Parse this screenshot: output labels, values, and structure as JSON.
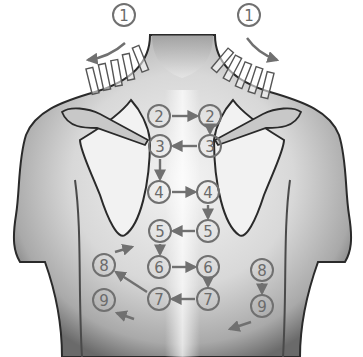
{
  "diagram": {
    "colors": {
      "background": "#ffffff",
      "skin_dark": "#3a3a3a",
      "skin_mid": "#9a9a9a",
      "skin_light": "#e6e6e6",
      "marker": "#707070"
    },
    "markers": [
      {
        "id": "m1a",
        "label": "1",
        "x": 124,
        "y": 15
      },
      {
        "id": "m1b",
        "label": "1",
        "x": 249,
        "y": 15
      },
      {
        "id": "m2a",
        "label": "2",
        "x": 159,
        "y": 116
      },
      {
        "id": "m2b",
        "label": "2",
        "x": 210,
        "y": 116
      },
      {
        "id": "m3a",
        "label": "3",
        "x": 160,
        "y": 146
      },
      {
        "id": "m3b",
        "label": "3",
        "x": 210,
        "y": 146
      },
      {
        "id": "m4a",
        "label": "4",
        "x": 159,
        "y": 192
      },
      {
        "id": "m4b",
        "label": "4",
        "x": 208,
        "y": 192
      },
      {
        "id": "m5a",
        "label": "5",
        "x": 160,
        "y": 231
      },
      {
        "id": "m5b",
        "label": "5",
        "x": 208,
        "y": 231
      },
      {
        "id": "m6a",
        "label": "6",
        "x": 159,
        "y": 267
      },
      {
        "id": "m6b",
        "label": "6",
        "x": 208,
        "y": 267
      },
      {
        "id": "m7a",
        "label": "7",
        "x": 159,
        "y": 299
      },
      {
        "id": "m7b",
        "label": "7",
        "x": 208,
        "y": 299
      },
      {
        "id": "m8a",
        "label": "8",
        "x": 104,
        "y": 265
      },
      {
        "id": "m8b",
        "label": "8",
        "x": 262,
        "y": 270
      },
      {
        "id": "m9a",
        "label": "9",
        "x": 104,
        "y": 300
      },
      {
        "id": "m9b",
        "label": "9",
        "x": 262,
        "y": 306
      }
    ],
    "arrows": [
      {
        "id": "a2-right",
        "from": [
          172,
          116
        ],
        "to": [
          197,
          116
        ]
      },
      {
        "id": "a2b-down",
        "from": [
          210,
          129
        ],
        "to": [
          210,
          133
        ]
      },
      {
        "id": "a3-left",
        "from": [
          197,
          146
        ],
        "to": [
          173,
          146
        ]
      },
      {
        "id": "a3-down",
        "from": [
          160,
          159
        ],
        "to": [
          160,
          179
        ]
      },
      {
        "id": "a4-right",
        "from": [
          172,
          192
        ],
        "to": [
          195,
          192
        ]
      },
      {
        "id": "a4b-down",
        "from": [
          208,
          205
        ],
        "to": [
          208,
          218
        ]
      },
      {
        "id": "a5-left",
        "from": [
          195,
          231
        ],
        "to": [
          173,
          231
        ]
      },
      {
        "id": "a5-down",
        "from": [
          160,
          244
        ],
        "to": [
          160,
          254
        ]
      },
      {
        "id": "a6-right",
        "from": [
          172,
          267
        ],
        "to": [
          195,
          267
        ]
      },
      {
        "id": "a6b-down",
        "from": [
          208,
          280
        ],
        "to": [
          208,
          286
        ]
      },
      {
        "id": "a7-left",
        "from": [
          195,
          299
        ],
        "to": [
          172,
          299
        ]
      },
      {
        "id": "a7-diag",
        "from": [
          147,
          292
        ],
        "to": [
          116,
          272
        ]
      },
      {
        "id": "a8a-out",
        "from": [
          115,
          252
        ],
        "to": [
          132,
          247
        ]
      },
      {
        "id": "a8b-down",
        "from": [
          262,
          283
        ],
        "to": [
          262,
          293
        ]
      },
      {
        "id": "a9a-out",
        "from": [
          134,
          319
        ],
        "to": [
          117,
          313
        ]
      },
      {
        "id": "a9b-out",
        "from": [
          251,
          322
        ],
        "to": [
          230,
          329
        ]
      }
    ]
  }
}
